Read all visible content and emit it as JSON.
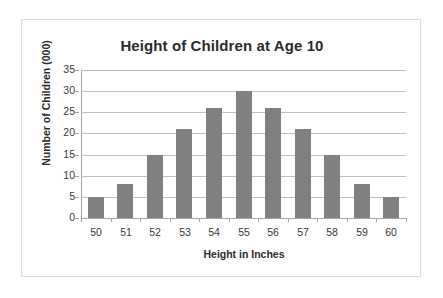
{
  "chart_data": {
    "type": "bar",
    "title": "Height of Children at Age 10",
    "xlabel": "Height in Inches",
    "ylabel": "Number of Children (000)",
    "categories": [
      "50",
      "51",
      "52",
      "53",
      "54",
      "55",
      "56",
      "57",
      "58",
      "59",
      "60"
    ],
    "values": [
      5,
      8,
      15,
      21,
      26,
      30,
      26,
      21,
      15,
      8,
      5
    ],
    "ylim": [
      0,
      35
    ],
    "ytick_labels": [
      "0",
      "5",
      "10",
      "15",
      "20",
      "25",
      "30",
      "35"
    ],
    "ytick_values": [
      0,
      5,
      10,
      15,
      20,
      25,
      30,
      35
    ],
    "grid": true,
    "legend": false,
    "bar_color": "#808080",
    "gridline_color": "#bfbfbf",
    "axis_color": "#a6a6a6",
    "border_color": "#dcdcdc",
    "background": "#ffffff",
    "text_color": "#2b2b2b"
  }
}
